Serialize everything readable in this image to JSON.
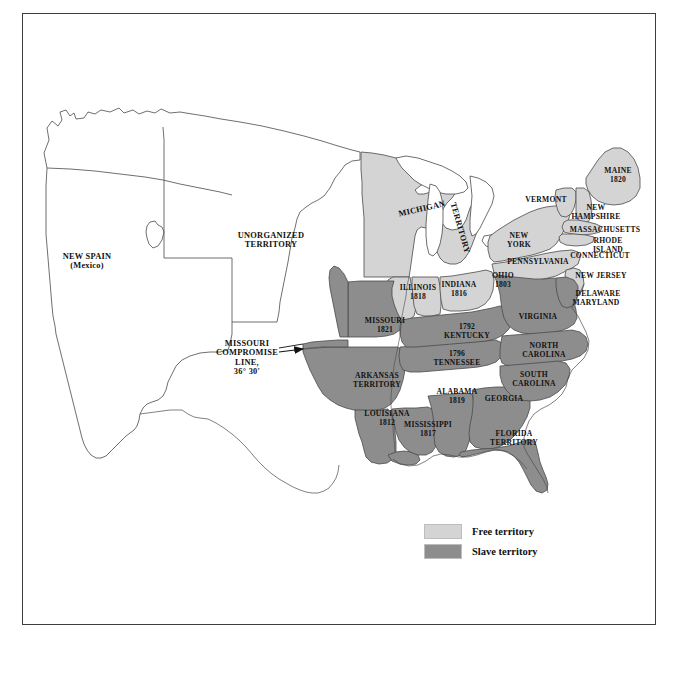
{
  "figure": {
    "domain": "map",
    "frame_color": "#3d3d3d",
    "background": "#ffffff"
  },
  "colors": {
    "free_territory": "#d4d4d4",
    "slave_territory": "#8d8d8d",
    "unshaded": "#ffffff",
    "outline": "#4a4a4a",
    "text": "#111111"
  },
  "legend": {
    "items": [
      {
        "label": "Free territory",
        "color": "#d4d4d4",
        "swatch_name": "free-territory-swatch"
      },
      {
        "label": "Slave territory",
        "color": "#8d8d8d",
        "swatch_name": "slave-territory-swatch"
      }
    ]
  },
  "annotations": {
    "compromise_line": {
      "label": "MISSOURI\nCOMPROMISE\nLINE,\n36° 30'",
      "x": 247,
      "y": 358,
      "arrow_from": [
        278,
        352
      ],
      "arrow_to": [
        303,
        349
      ]
    }
  },
  "labels": [
    {
      "name": "new-spain",
      "text": "NEW SPAIN\n(Mexico)",
      "x": 87,
      "y": 261,
      "size": "lg",
      "fill": "unshaded"
    },
    {
      "name": "unorganized-territory",
      "text": "UNORGANIZED\nTERRITORY",
      "x": 271,
      "y": 240,
      "size": "lg",
      "fill": "unshaded"
    },
    {
      "name": "michigan-territory-michigan",
      "text": "MICHIGAN",
      "x": 422,
      "y": 209,
      "size": "lg",
      "rotate": -13,
      "fill": "free"
    },
    {
      "name": "michigan-territory-territory",
      "text": "TERRITORY",
      "x": 460,
      "y": 228,
      "size": "lg",
      "rotate": 74,
      "fill": "free"
    },
    {
      "name": "illinois",
      "text": "ILLINOIS\n1818",
      "x": 418,
      "y": 292,
      "size": "md",
      "fill": "free"
    },
    {
      "name": "indiana",
      "text": "INDIANA\n1816",
      "x": 459,
      "y": 289,
      "size": "md",
      "fill": "free"
    },
    {
      "name": "ohio",
      "text": "OHIO\n1803",
      "x": 503,
      "y": 280,
      "size": "md",
      "fill": "free"
    },
    {
      "name": "pennsylvania",
      "text": "PENNSYLVANIA",
      "x": 538,
      "y": 262,
      "size": "md",
      "fill": "free"
    },
    {
      "name": "new-york",
      "text": "NEW\nYORK",
      "x": 519,
      "y": 240,
      "size": "md",
      "fill": "free"
    },
    {
      "name": "vermont",
      "text": "VERMONT",
      "x": 546,
      "y": 200,
      "size": "md",
      "fill": "free"
    },
    {
      "name": "new-hampshire",
      "text": "NEW\nHAMPSHIRE",
      "x": 596,
      "y": 212,
      "size": "md",
      "fill": "free"
    },
    {
      "name": "massachusetts",
      "text": "MASSACHUSETTS",
      "x": 605,
      "y": 230,
      "size": "md",
      "fill": "free"
    },
    {
      "name": "rhode-island",
      "text": "RHODE\nISLAND",
      "x": 608,
      "y": 245,
      "size": "md",
      "fill": "free"
    },
    {
      "name": "connecticut",
      "text": "CONNECTICUT",
      "x": 600,
      "y": 256,
      "size": "md",
      "fill": "free"
    },
    {
      "name": "maine",
      "text": "MAINE\n1820",
      "x": 618,
      "y": 175,
      "size": "md",
      "fill": "free"
    },
    {
      "name": "new-jersey",
      "text": "NEW JERSEY",
      "x": 601,
      "y": 276,
      "size": "md",
      "fill": "free"
    },
    {
      "name": "delaware",
      "text": "DELAWARE",
      "x": 598,
      "y": 294,
      "size": "md",
      "fill": "slave"
    },
    {
      "name": "maryland",
      "text": "MARYLAND",
      "x": 596,
      "y": 303,
      "size": "md",
      "fill": "slave"
    },
    {
      "name": "virginia",
      "text": "VIRGINIA",
      "x": 538,
      "y": 317,
      "size": "md",
      "fill": "slave"
    },
    {
      "name": "missouri",
      "text": "MISSOURI\n1821",
      "x": 385,
      "y": 325,
      "size": "md",
      "fill": "slave"
    },
    {
      "name": "kentucky",
      "text": "1792\nKENTUCKY",
      "x": 467,
      "y": 331,
      "size": "md",
      "fill": "slave"
    },
    {
      "name": "tennessee",
      "text": "1796\nTENNESSEE",
      "x": 457,
      "y": 358,
      "size": "md",
      "fill": "slave"
    },
    {
      "name": "north-carolina",
      "text": "NORTH\nCAROLINA",
      "x": 544,
      "y": 350,
      "size": "md",
      "fill": "slave"
    },
    {
      "name": "south-carolina",
      "text": "SOUTH\nCAROLINA",
      "x": 534,
      "y": 379,
      "size": "md",
      "fill": "slave"
    },
    {
      "name": "arkansas-territory",
      "text": "ARKANSAS\nTERRITORY",
      "x": 377,
      "y": 380,
      "size": "md",
      "fill": "slave"
    },
    {
      "name": "alabama",
      "text": "ALABAMA\n1819",
      "x": 457,
      "y": 396,
      "size": "md",
      "fill": "slave"
    },
    {
      "name": "georgia",
      "text": "GEORGIA",
      "x": 504,
      "y": 399,
      "size": "md",
      "fill": "slave"
    },
    {
      "name": "louisiana",
      "text": "LOUISIANA\n1812",
      "x": 387,
      "y": 418,
      "size": "md",
      "fill": "slave"
    },
    {
      "name": "mississippi",
      "text": "MISSISSIPPI\n1817",
      "x": 428,
      "y": 429,
      "size": "md",
      "fill": "slave"
    },
    {
      "name": "florida-territory",
      "text": "FLORIDA\nTERRITORY",
      "x": 514,
      "y": 438,
      "size": "md",
      "fill": "slave"
    }
  ]
}
